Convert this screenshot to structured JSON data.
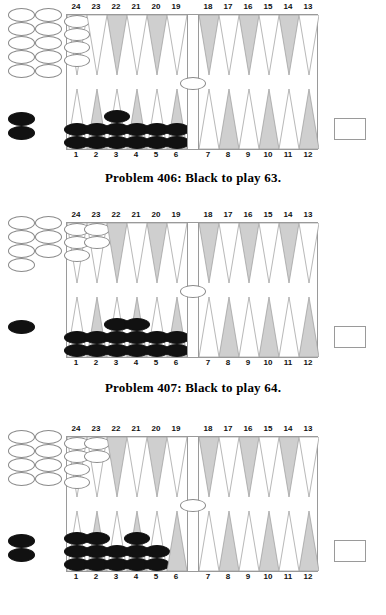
{
  "colors": {
    "point_light": "#ffffff",
    "point_dark": "#cfcfcf",
    "point_outline": "#9a9a9a",
    "black_checker": "#111111",
    "white_checker": "#ffffff",
    "white_checker_outline": "#8a8a8a",
    "frame": "#9a9a9a",
    "text": "#000000",
    "page_background": "#ffffff"
  },
  "point_numbers": {
    "top": [
      "24",
      "23",
      "22",
      "21",
      "20",
      "19",
      "18",
      "17",
      "16",
      "15",
      "14",
      "13"
    ],
    "bottom": [
      "1",
      "2",
      "3",
      "4",
      "5",
      "6",
      "7",
      "8",
      "9",
      "10",
      "11",
      "12"
    ]
  },
  "point_shading": {
    "top": [
      "light",
      "light",
      "dark",
      "light",
      "dark",
      "light",
      "dark",
      "light",
      "dark",
      "light",
      "dark",
      "light"
    ],
    "bottom": [
      "light",
      "dark",
      "light",
      "dark",
      "light",
      "dark",
      "light",
      "dark",
      "light",
      "dark",
      "light",
      "dark"
    ]
  },
  "problems": [
    {
      "id": "problem-406",
      "caption": "Problem 406:  Black to play 63.",
      "number": "406",
      "player": "Black",
      "roll": "63",
      "off_white": 10,
      "off_black": 2,
      "bar_white": 1,
      "bar_black": 0,
      "top_points": [
        {
          "point": "24",
          "color": "white",
          "count": 4
        },
        {
          "point": "23",
          "color": "none",
          "count": 0
        },
        {
          "point": "22",
          "color": "none",
          "count": 0
        },
        {
          "point": "21",
          "color": "none",
          "count": 0
        },
        {
          "point": "20",
          "color": "none",
          "count": 0
        },
        {
          "point": "19",
          "color": "none",
          "count": 0
        },
        {
          "point": "18",
          "color": "none",
          "count": 0
        },
        {
          "point": "17",
          "color": "none",
          "count": 0
        },
        {
          "point": "16",
          "color": "none",
          "count": 0
        },
        {
          "point": "15",
          "color": "none",
          "count": 0
        },
        {
          "point": "14",
          "color": "none",
          "count": 0
        },
        {
          "point": "13",
          "color": "none",
          "count": 0
        }
      ],
      "bottom_points": [
        {
          "point": "1",
          "color": "black",
          "count": 2
        },
        {
          "point": "2",
          "color": "black",
          "count": 2
        },
        {
          "point": "3",
          "color": "black",
          "count": 3
        },
        {
          "point": "4",
          "color": "black",
          "count": 2
        },
        {
          "point": "5",
          "color": "black",
          "count": 2
        },
        {
          "point": "6",
          "color": "black",
          "count": 2
        },
        {
          "point": "7",
          "color": "none",
          "count": 0
        },
        {
          "point": "8",
          "color": "none",
          "count": 0
        },
        {
          "point": "9",
          "color": "none",
          "count": 0
        },
        {
          "point": "10",
          "color": "none",
          "count": 0
        },
        {
          "point": "11",
          "color": "none",
          "count": 0
        },
        {
          "point": "12",
          "color": "none",
          "count": 0
        }
      ]
    },
    {
      "id": "problem-407",
      "caption": "Problem 407:  Black to play 64.",
      "number": "407",
      "player": "Black",
      "roll": "64",
      "off_white": 7,
      "off_black": 1,
      "bar_white": 1,
      "bar_black": 0,
      "top_points": [
        {
          "point": "24",
          "color": "white",
          "count": 3
        },
        {
          "point": "23",
          "color": "white",
          "count": 2
        },
        {
          "point": "22",
          "color": "none",
          "count": 0
        },
        {
          "point": "21",
          "color": "none",
          "count": 0
        },
        {
          "point": "20",
          "color": "none",
          "count": 0
        },
        {
          "point": "19",
          "color": "none",
          "count": 0
        },
        {
          "point": "18",
          "color": "none",
          "count": 0
        },
        {
          "point": "17",
          "color": "none",
          "count": 0
        },
        {
          "point": "16",
          "color": "none",
          "count": 0
        },
        {
          "point": "15",
          "color": "none",
          "count": 0
        },
        {
          "point": "14",
          "color": "none",
          "count": 0
        },
        {
          "point": "13",
          "color": "none",
          "count": 0
        }
      ],
      "bottom_points": [
        {
          "point": "1",
          "color": "black",
          "count": 2
        },
        {
          "point": "2",
          "color": "black",
          "count": 2
        },
        {
          "point": "3",
          "color": "black",
          "count": 3
        },
        {
          "point": "4",
          "color": "black",
          "count": 3
        },
        {
          "point": "5",
          "color": "black",
          "count": 2
        },
        {
          "point": "6",
          "color": "black",
          "count": 2
        },
        {
          "point": "7",
          "color": "none",
          "count": 0
        },
        {
          "point": "8",
          "color": "none",
          "count": 0
        },
        {
          "point": "9",
          "color": "none",
          "count": 0
        },
        {
          "point": "10",
          "color": "none",
          "count": 0
        },
        {
          "point": "11",
          "color": "none",
          "count": 0
        },
        {
          "point": "12",
          "color": "none",
          "count": 0
        }
      ]
    },
    {
      "id": "problem-408",
      "caption": "",
      "number": "",
      "player": "Black",
      "roll": "",
      "off_white": 8,
      "off_black": 2,
      "bar_white": 1,
      "bar_black": 0,
      "top_points": [
        {
          "point": "24",
          "color": "white",
          "count": 4
        },
        {
          "point": "23",
          "color": "white",
          "count": 2
        },
        {
          "point": "22",
          "color": "none",
          "count": 0
        },
        {
          "point": "21",
          "color": "none",
          "count": 0
        },
        {
          "point": "20",
          "color": "none",
          "count": 0
        },
        {
          "point": "19",
          "color": "none",
          "count": 0
        },
        {
          "point": "18",
          "color": "none",
          "count": 0
        },
        {
          "point": "17",
          "color": "none",
          "count": 0
        },
        {
          "point": "16",
          "color": "none",
          "count": 0
        },
        {
          "point": "15",
          "color": "none",
          "count": 0
        },
        {
          "point": "14",
          "color": "none",
          "count": 0
        },
        {
          "point": "13",
          "color": "none",
          "count": 0
        }
      ],
      "bottom_points": [
        {
          "point": "1",
          "color": "black",
          "count": 3
        },
        {
          "point": "2",
          "color": "black",
          "count": 3
        },
        {
          "point": "3",
          "color": "black",
          "count": 2
        },
        {
          "point": "4",
          "color": "black",
          "count": 3
        },
        {
          "point": "5",
          "color": "black",
          "count": 2
        },
        {
          "point": "6",
          "color": "none",
          "count": 0
        },
        {
          "point": "7",
          "color": "none",
          "count": 0
        },
        {
          "point": "8",
          "color": "none",
          "count": 0
        },
        {
          "point": "9",
          "color": "none",
          "count": 0
        },
        {
          "point": "10",
          "color": "none",
          "count": 0
        },
        {
          "point": "11",
          "color": "none",
          "count": 0
        },
        {
          "point": "12",
          "color": "none",
          "count": 0
        }
      ]
    }
  ]
}
